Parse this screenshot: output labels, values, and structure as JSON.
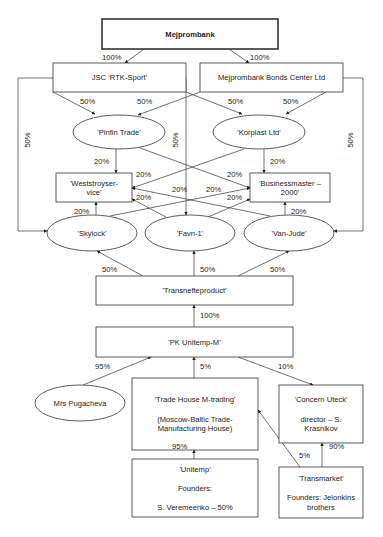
{
  "diagram": {
    "nodes": [
      {
        "id": "mejprombank",
        "shape": "rect",
        "x": 102,
        "y": 19,
        "w": 176,
        "h": 30,
        "thick": true,
        "bold": true,
        "lines": [
          "Mejprombank"
        ]
      },
      {
        "id": "rtk_sport",
        "shape": "rect",
        "x": 53,
        "y": 63,
        "w": 133,
        "h": 29,
        "lines": [
          "JSC ‘RTK-Sport’"
        ]
      },
      {
        "id": "bonds_center",
        "shape": "rect",
        "x": 200,
        "y": 63,
        "w": 143,
        "h": 29,
        "lines": [
          "Mejprombank Bonds Center Ltd"
        ]
      },
      {
        "id": "pinfin_trade",
        "shape": "ellipse",
        "cx": 119,
        "cy": 132,
        "rx": 46,
        "ry": 17,
        "lines": [
          "'Pinfin Trade'"
        ]
      },
      {
        "id": "korplast",
        "shape": "ellipse",
        "cx": 259,
        "cy": 132,
        "rx": 46,
        "ry": 17,
        "lines": [
          "'Korplast Ltd'"
        ]
      },
      {
        "id": "weststroy",
        "shape": "rect",
        "x": 56,
        "y": 173,
        "w": 76,
        "h": 29,
        "lines": [
          "'Weststroyser-",
          "vice'"
        ]
      },
      {
        "id": "businessmaster",
        "shape": "rect",
        "x": 250,
        "y": 173,
        "w": 80,
        "h": 29,
        "lines": [
          "'Businessmaster –",
          "2000'"
        ]
      },
      {
        "id": "skylock",
        "shape": "ellipse",
        "cx": 92,
        "cy": 233,
        "rx": 45,
        "ry": 18,
        "lines": [
          "'Skylock'"
        ]
      },
      {
        "id": "favn1",
        "shape": "ellipse",
        "cx": 190,
        "cy": 233,
        "rx": 45,
        "ry": 18,
        "lines": [
          "'Favn-1'"
        ]
      },
      {
        "id": "van_jude",
        "shape": "ellipse",
        "cx": 289,
        "cy": 233,
        "rx": 45,
        "ry": 18,
        "lines": [
          "'Van-Jude'"
        ]
      },
      {
        "id": "transnefteproduct",
        "shape": "rect",
        "x": 96,
        "y": 276,
        "w": 197,
        "h": 29,
        "lines": [
          "'Transnefteproduct'"
        ]
      },
      {
        "id": "pk_unitemp",
        "shape": "rect",
        "x": 96,
        "y": 327,
        "w": 197,
        "h": 30,
        "lines": [
          "'PK Unitemp-M'"
        ]
      },
      {
        "id": "pugacheva",
        "shape": "ellipse",
        "cx": 80,
        "cy": 403,
        "rx": 45,
        "ry": 18,
        "lines": [
          "Mrs Pugacheva"
        ]
      },
      {
        "id": "trade_house",
        "shape": "rect",
        "x": 132,
        "y": 378,
        "w": 126,
        "h": 72,
        "lines": [
          "'Trade House M-trading'",
          "",
          "(Moscow-Baltic Trade-",
          "Manufacturing House)"
        ]
      },
      {
        "id": "concern_uteck",
        "shape": "rect",
        "x": 279,
        "y": 385,
        "w": 84,
        "h": 58,
        "lines": [
          "'Concern Uteck'",
          "",
          "director – S.",
          "Krasnikov"
        ]
      },
      {
        "id": "unitemp",
        "shape": "rect",
        "x": 132,
        "y": 459,
        "w": 126,
        "h": 58,
        "lines": [
          "'Unitemp'",
          "",
          "Founders:",
          "",
          "S. Veremeenko – 50%"
        ]
      },
      {
        "id": "transmarket",
        "shape": "rect",
        "x": 279,
        "y": 467,
        "w": 84,
        "h": 51,
        "lines": [
          "'Transmarket'",
          "",
          "Founders: Jelonkins",
          "brothers"
        ]
      }
    ],
    "edges": [
      {
        "from": "mejprombank",
        "to": "rtk_sport",
        "label": "100%",
        "pts": [
          [
            144,
            49
          ],
          [
            125,
            63
          ]
        ],
        "lx": 102,
        "ly": 60
      },
      {
        "from": "mejprombank",
        "to": "bonds_center",
        "label": "100%",
        "pts": [
          [
            229,
            49
          ],
          [
            249,
            63
          ]
        ],
        "lx": 250,
        "ly": 60
      },
      {
        "from": "rtk_sport",
        "to": "pinfin_trade",
        "label": "50%",
        "pts": [
          [
            53,
            92
          ],
          [
            95,
            114
          ]
        ],
        "lx": 80,
        "ly": 104
      },
      {
        "from": "bonds_center",
        "to": "pinfin_trade",
        "label": "50%",
        "pts": [
          [
            200,
            92
          ],
          [
            138,
            115
          ]
        ],
        "lx": 137,
        "ly": 104
      },
      {
        "from": "rtk_sport",
        "to": "korplast",
        "label": "50%",
        "pts": [
          [
            186,
            92
          ],
          [
            242,
            114
          ]
        ],
        "lx": 228,
        "ly": 104
      },
      {
        "from": "bonds_center",
        "to": "korplast",
        "label": "50%",
        "pts": [
          [
            326,
            92
          ],
          [
            286,
            114
          ]
        ],
        "lx": 283,
        "ly": 104
      },
      {
        "from": "rtk_sport",
        "to": "skylock",
        "label": "50%",
        "rot": true,
        "pts": [
          [
            53,
            78
          ],
          [
            18,
            78
          ],
          [
            18,
            231
          ],
          [
            47,
            231
          ]
        ],
        "lx": 30,
        "ly": 140
      },
      {
        "from": "rtk_sport",
        "to": "favn1",
        "label": "50%",
        "rot": true,
        "pts": [
          [
            178,
            78
          ],
          [
            186,
            78
          ],
          [
            186,
            215
          ]
        ],
        "lx": 178,
        "ly": 140
      },
      {
        "from": "bonds_center",
        "to": "van_jude",
        "label": "50%",
        "rot": true,
        "pts": [
          [
            343,
            78
          ],
          [
            363,
            78
          ],
          [
            363,
            231
          ],
          [
            334,
            231
          ]
        ],
        "lx": 353,
        "ly": 140
      },
      {
        "from": "pinfin_trade",
        "to": "weststroy",
        "label": "20%",
        "pts": [
          [
            116,
            149
          ],
          [
            116,
            173
          ]
        ],
        "lx": 94,
        "ly": 164
      },
      {
        "from": "korplast",
        "to": "businessmaster",
        "label": "20%",
        "pts": [
          [
            264,
            149
          ],
          [
            264,
            173
          ]
        ],
        "lx": 270,
        "ly": 164
      },
      {
        "from": "pinfin_trade",
        "to": "businessmaster",
        "label": "20%",
        "pts": [
          [
            140,
            148
          ],
          [
            250,
            188
          ]
        ],
        "lx": 227,
        "ly": 177
      },
      {
        "from": "korplast",
        "to": "weststroy",
        "label": "20%",
        "pts": [
          [
            244,
            149
          ],
          [
            132,
            188
          ]
        ],
        "lx": 136,
        "ly": 177
      },
      {
        "from": "skylock",
        "to": "weststroy",
        "label": "20%",
        "pts": [
          [
            96,
            215
          ],
          [
            96,
            202
          ]
        ],
        "lx": 74,
        "ly": 214
      },
      {
        "from": "van_jude",
        "to": "businessmaster",
        "label": "20%",
        "pts": [
          [
            285,
            215
          ],
          [
            285,
            202
          ]
        ],
        "lx": 291,
        "ly": 214
      },
      {
        "from": "skylock",
        "to": "businessmaster",
        "label": "20%",
        "pts": [
          [
            110,
            216
          ],
          [
            250,
            188
          ]
        ],
        "lx": 206,
        "ly": 192
      },
      {
        "from": "van_jude",
        "to": "weststroy",
        "label": "20%",
        "pts": [
          [
            270,
            216
          ],
          [
            132,
            188
          ]
        ],
        "lx": 172,
        "ly": 192
      },
      {
        "from": "favn1",
        "to": "weststroy",
        "label": "20%",
        "pts": [
          [
            166,
            217
          ],
          [
            132,
            199
          ]
        ],
        "lx": 136,
        "ly": 200
      },
      {
        "from": "favn1",
        "to": "businessmaster",
        "label": "20%",
        "pts": [
          [
            208,
            217
          ],
          [
            250,
            199
          ]
        ],
        "lx": 227,
        "ly": 200
      },
      {
        "from": "transnefteproduct",
        "to": "skylock",
        "label": "50%",
        "pts": [
          [
            143,
            276
          ],
          [
            97,
            251
          ]
        ],
        "lx": 102,
        "ly": 272
      },
      {
        "from": "transnefteproduct",
        "to": "favn1",
        "label": "50%",
        "pts": [
          [
            194,
            276
          ],
          [
            194,
            251
          ]
        ],
        "lx": 200,
        "ly": 272
      },
      {
        "from": "transnefteproduct",
        "to": "van_jude",
        "label": "50%",
        "pts": [
          [
            238,
            276
          ],
          [
            289,
            251
          ]
        ],
        "lx": 270,
        "ly": 272
      },
      {
        "from": "pk_unitemp",
        "to": "transnefteproduct",
        "label": "100%",
        "pts": [
          [
            194,
            327
          ],
          [
            194,
            305
          ]
        ],
        "lx": 200,
        "ly": 318
      },
      {
        "from": "pugacheva",
        "to": "pk_unitemp",
        "label": "95%",
        "pts": [
          [
            83,
            385
          ],
          [
            151,
            357
          ]
        ],
        "lx": 95,
        "ly": 369
      },
      {
        "from": "trade_house",
        "to": "pk_unitemp",
        "label": "5%",
        "pts": [
          [
            194,
            378
          ],
          [
            194,
            357
          ]
        ],
        "lx": 200,
        "ly": 369
      },
      {
        "from": "pk_unitemp",
        "to": "concern_uteck",
        "label": "10%",
        "pts": [
          [
            238,
            357
          ],
          [
            313,
            385
          ]
        ],
        "lx": 278,
        "ly": 369
      },
      {
        "from": "unitemp",
        "to": "trade_house",
        "label": "95%",
        "pts": [
          [
            194,
            459
          ],
          [
            194,
            450
          ]
        ],
        "lx": 172,
        "ly": 449
      },
      {
        "from": "transmarket",
        "to": "trade_house",
        "label": "5%",
        "pts": [
          [
            300,
            467
          ],
          [
            258,
            410
          ]
        ],
        "lx": 299,
        "ly": 458
      },
      {
        "from": "transmarket",
        "to": "concern_uteck",
        "label": "90%",
        "pts": [
          [
            322,
            467
          ],
          [
            322,
            443
          ]
        ],
        "lx": 329,
        "ly": 449
      }
    ]
  }
}
